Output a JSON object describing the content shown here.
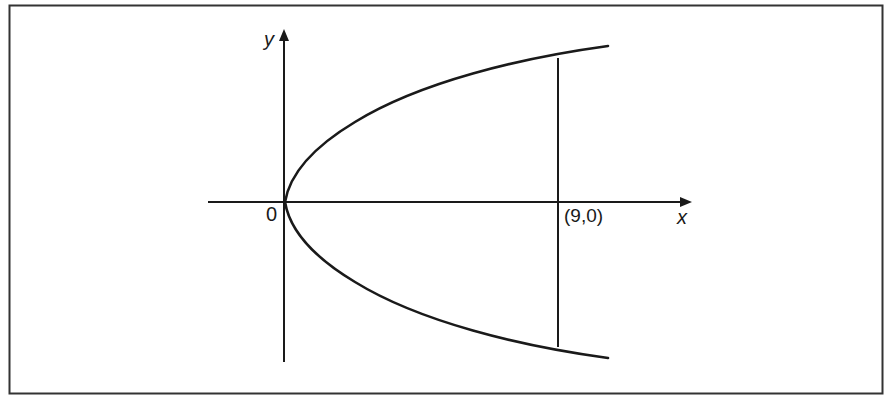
{
  "figure": {
    "type": "parabola-diagram",
    "equation_shape": "rightward-opening parabola with vertex at origin",
    "frame": true,
    "axes": {
      "x_label": "x",
      "y_label": "y",
      "origin_label": "0"
    },
    "annotations": {
      "point_label": "(9,0)"
    },
    "vertical_line": {
      "x_value": 9,
      "description": "vertical chord at x = 9"
    },
    "colors": {
      "stroke": "#1a1a1a",
      "frame": "#333333",
      "background": "#ffffff"
    }
  }
}
